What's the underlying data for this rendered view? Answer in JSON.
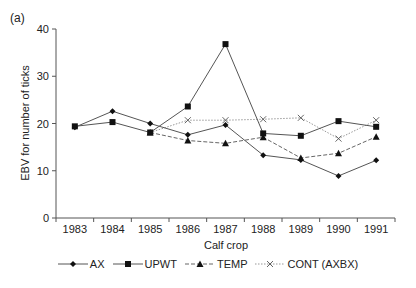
{
  "panel_label": "(a)",
  "chart_data": {
    "type": "line",
    "title": "",
    "xlabel": "Calf crop",
    "ylabel": "EBV for number of ticks",
    "ylim": [
      0,
      40
    ],
    "yticks": [
      0,
      10,
      20,
      30,
      40
    ],
    "grid": false,
    "legend_position": "bottom",
    "categories": [
      "1983",
      "1984",
      "1985",
      "1986",
      "1987",
      "1988",
      "1989",
      "1990",
      "1991"
    ],
    "series": [
      {
        "name": "AX",
        "marker": "diamond",
        "style": "solid",
        "values": [
          19.2,
          22.6,
          20.0,
          17.6,
          19.7,
          13.3,
          12.3,
          8.9,
          12.2
        ]
      },
      {
        "name": "UPWT",
        "marker": "square",
        "style": "solid",
        "values": [
          19.4,
          20.3,
          18.1,
          23.6,
          36.8,
          17.9,
          17.4,
          20.5,
          19.3
        ]
      },
      {
        "name": "TEMP",
        "marker": "triangle",
        "style": "dashed",
        "values": [
          null,
          null,
          18.1,
          16.4,
          15.8,
          17.1,
          12.7,
          13.7,
          17.2
        ]
      },
      {
        "name": "CONT (AXBX)",
        "marker": "x",
        "style": "dotted",
        "values": [
          null,
          null,
          18.1,
          20.7,
          20.7,
          20.9,
          21.2,
          16.8,
          20.7
        ]
      }
    ]
  }
}
